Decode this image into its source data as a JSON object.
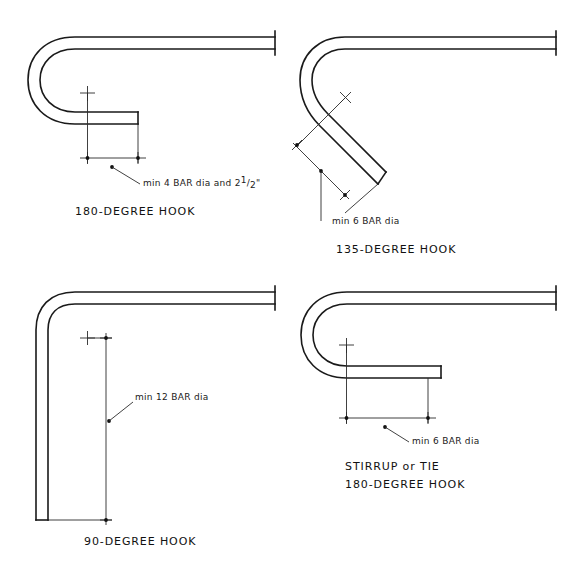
{
  "sheet": {
    "background_color": "#ffffff",
    "line_color": "#1a1a1a",
    "thin_line_color": "#2b2b2b",
    "width": 581,
    "height": 578
  },
  "figures": [
    {
      "id": "hook-180",
      "title": "180-DEGREE HOOK",
      "annotation": "min 4 BAR dia and 2",
      "annotation_fraction_numerator": "1",
      "annotation_fraction_denominator": "2",
      "annotation_suffix": "\"",
      "annotation_full": "min 4 BAR dia and 2 1/2\"",
      "bend_type": "180 degree",
      "min_bend_diameter": "4 BAR dia and 2 1/2\""
    },
    {
      "id": "hook-135",
      "title": "135-DEGREE HOOK",
      "annotation": "min 6 BAR dia",
      "bend_type": "135 degree",
      "min_bend_diameter": "6 BAR dia"
    },
    {
      "id": "hook-90",
      "title": "90-DEGREE HOOK",
      "annotation": "min 12 BAR dia",
      "bend_type": "90 degree",
      "min_bend_diameter": "12 BAR dia"
    },
    {
      "id": "hook-stirrup-180",
      "title_line1": "STIRRUP or TIE",
      "title_line2": "180-DEGREE HOOK",
      "annotation": "min 6 BAR dia",
      "bend_type": "180 degree stirrup or tie",
      "min_bend_diameter": "6 BAR dia"
    }
  ]
}
